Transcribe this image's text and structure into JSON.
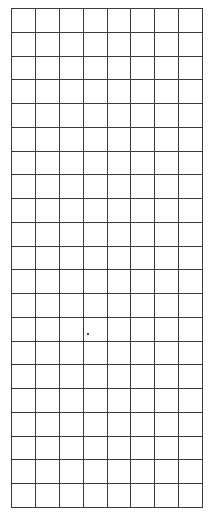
{
  "grid": {
    "columns": 8,
    "rows": 21,
    "line_color": "#3a3a3a",
    "background": "#ffffff"
  }
}
